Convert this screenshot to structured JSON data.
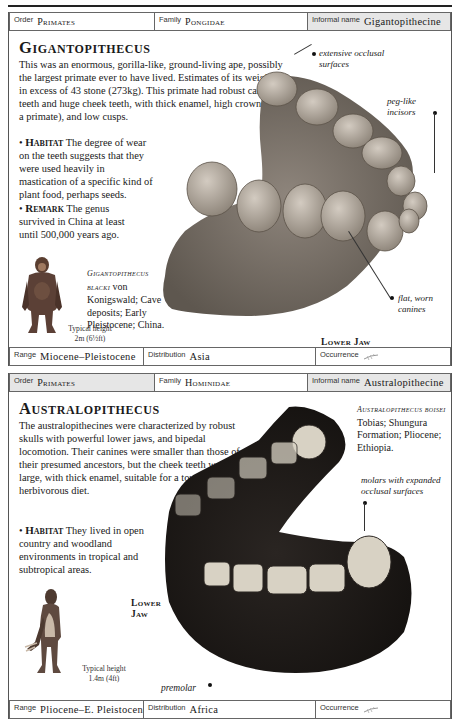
{
  "labels": {
    "order": "Order",
    "family": "Family",
    "informal_name": "Informal name",
    "range": "Range",
    "distribution": "Distribution",
    "occurrence": "Occurrence"
  },
  "entries": [
    {
      "header": {
        "order": "Primates",
        "family": "Pongidae",
        "informal_name": "Gigantopithecine"
      },
      "title": "Gigantopithecus",
      "description": "This was an enormous, gorilla-like, ground-living ape, possibly the largest primate ever to have lived. Estimates of its weight are in excess of 43 stone (273kg). This primate had robust canine teeth and huge cheek teeth, with thick enamel, high crowns (for a primate), and low cusps.",
      "sections": [
        {
          "heading": "Habitat",
          "text": "The degree of wear on the teeth suggests that they were used heavily in mastication of a specific kind of plant food, perhaps seeds."
        },
        {
          "heading": "Remark",
          "text": "The genus survived in China at least until 500,000 years ago."
        }
      ],
      "specimen": {
        "name": "Gigantopithecus blacki",
        "details": "von Konigswald; Cave deposits; Early Pleistocene; China."
      },
      "height": {
        "label": "Typical height",
        "value": "2m (6½ft)"
      },
      "annotations": [
        "extensive occlusal surfaces",
        "peg-like incisors",
        "flat, worn canines"
      ],
      "image_label": "Lower Jaw",
      "footer": {
        "range": "Miocene–Pleistocene",
        "distribution": "Asia",
        "occurrence_icon": "fern-frond-icon"
      }
    },
    {
      "header": {
        "order": "Primates",
        "family": "Hominidae",
        "informal_name": "Australopithecine"
      },
      "title": "Australopithecus",
      "description": "The australopithecines were characterized by robust skulls with powerful lower jaws, and bipedal locomotion. Their canines were smaller than those of their presumed ancestors, but the cheek teeth were large, with thick enamel, suitable for a tough, herbivorous diet.",
      "sections": [
        {
          "heading": "Habitat",
          "text": "They lived in open country and woodland environments in tropical and subtropical areas."
        }
      ],
      "specimen": {
        "name": "Australopithecus boisei",
        "details": "Tobias; Shungura Formation; Pliocene; Ethiopia."
      },
      "height": {
        "label": "Typical height",
        "value": "1.4m (4ft)"
      },
      "annotations": [
        "molars with expanded occlusal surfaces",
        "premolar"
      ],
      "image_label": "Lower Jaw",
      "footer": {
        "range": "Pliocene–E. Pleistocene",
        "distribution": "Africa",
        "occurrence_icon": "fern-frond-icon"
      }
    }
  ]
}
